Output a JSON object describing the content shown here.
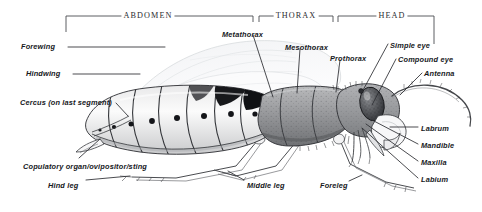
{
  "figure": {
    "kind": "entomology-anatomy-diagram",
    "background_color": "#ffffff",
    "ink_color": "#16181c"
  },
  "region_brackets": [
    {
      "id": "abdomen",
      "label": "ABDOMEN",
      "x1": 66,
      "x2": 253,
      "y": 16,
      "text_x": 148,
      "text_y": 12
    },
    {
      "id": "thorax",
      "label": "THORAX",
      "x1": 259,
      "x2": 333,
      "y": 16,
      "text_x": 296,
      "text_y": 12
    },
    {
      "id": "head",
      "label": "HEAD",
      "x1": 338,
      "x2": 434,
      "y": 16,
      "text_x": 392,
      "text_y": 12
    }
  ],
  "labels": [
    {
      "id": "forewing",
      "text": "Forewing",
      "x": 21,
      "y": 43,
      "align": "left"
    },
    {
      "id": "hindwing",
      "text": "Hindwing",
      "x": 26,
      "y": 70,
      "align": "left"
    },
    {
      "id": "cercus",
      "text": "Cercus (on last segment)",
      "x": 20,
      "y": 99,
      "align": "left"
    },
    {
      "id": "copulatory",
      "text": "Copulatory organ/ovipositor/sting",
      "x": 23,
      "y": 163,
      "align": "left"
    },
    {
      "id": "hindleg",
      "text": "Hind leg",
      "x": 48,
      "y": 182,
      "align": "left"
    },
    {
      "id": "middleleg",
      "text": "Middle leg",
      "x": 247,
      "y": 182,
      "align": "left"
    },
    {
      "id": "foreleg",
      "text": "Foreleg",
      "x": 320,
      "y": 182,
      "align": "left"
    },
    {
      "id": "metathorax",
      "text": "Metathorax",
      "x": 222,
      "y": 31,
      "align": "left"
    },
    {
      "id": "mesothorax",
      "text": "Mesothorax",
      "x": 285,
      "y": 44,
      "align": "left"
    },
    {
      "id": "prothorax",
      "text": "Prothorax",
      "x": 330,
      "y": 55,
      "align": "left"
    },
    {
      "id": "simple-eye",
      "text": "Simple eye",
      "x": 390,
      "y": 42,
      "align": "left"
    },
    {
      "id": "compound-eye",
      "text": "Compound eye",
      "x": 398,
      "y": 56,
      "align": "left"
    },
    {
      "id": "antenna",
      "text": "Antenna",
      "x": 424,
      "y": 70,
      "align": "left"
    },
    {
      "id": "labrum",
      "text": "Labrum",
      "x": 421,
      "y": 125,
      "align": "left"
    },
    {
      "id": "mandible",
      "text": "Mandible",
      "x": 421,
      "y": 142,
      "align": "left"
    },
    {
      "id": "maxilla",
      "text": "Maxilla",
      "x": 421,
      "y": 159,
      "align": "left"
    },
    {
      "id": "labium",
      "text": "Labium",
      "x": 421,
      "y": 176,
      "align": "left"
    }
  ],
  "leader_lines": [
    {
      "for": "forewing",
      "path": "M 68 47 L 165 47"
    },
    {
      "for": "hindwing",
      "path": "M 73 74 L 140 74"
    },
    {
      "for": "cercus",
      "path": "M 116 103 L 128 116"
    },
    {
      "for": "copulatory",
      "path": "M 79 158 L 100 139"
    },
    {
      "for": "hindleg",
      "path": "M 86 180 L 130 176"
    },
    {
      "for": "middleleg",
      "path": "M 244 180 L 228 171"
    },
    {
      "for": "foreleg",
      "path": "M 349 181 L 362 175"
    },
    {
      "for": "metathorax",
      "path": "M 253 35 L 273 97"
    },
    {
      "for": "mesothorax",
      "path": "M 300 49 L 297 93"
    },
    {
      "for": "prothorax",
      "path": "M 340 60 L 336 92"
    },
    {
      "for": "simple-eye",
      "path": "M 388 44 L 362 92"
    },
    {
      "for": "compound-eye",
      "path": "M 396 59 L 372 105"
    },
    {
      "for": "antenna",
      "path": "M 422 73 L 400 95"
    },
    {
      "for": "labrum",
      "path": "M 418 127 L 390 127"
    },
    {
      "for": "mandible",
      "path": "M 418 144 L 372 120"
    },
    {
      "for": "maxilla",
      "path": "M 418 161 L 366 124"
    },
    {
      "for": "labium",
      "path": "M 418 178 L 362 128"
    }
  ],
  "anatomy_parts": [
    {
      "name": "abdomen",
      "description": "banded segmented abdomen with dark spiracle dots"
    },
    {
      "name": "thorax",
      "description": "stippled grey thoracic segments"
    },
    {
      "name": "head",
      "description": "head capsule bearing eyes and mouthparts"
    },
    {
      "name": "compound-eye",
      "description": "large dark stippled oval eye"
    },
    {
      "name": "forewing",
      "description": "faint translucent anterior wing"
    },
    {
      "name": "hindwing",
      "description": "faint translucent posterior wing"
    },
    {
      "name": "antenna",
      "description": "long arcing segmented antenna"
    },
    {
      "name": "foreleg",
      "description": "anterior leg"
    },
    {
      "name": "middleleg",
      "description": "mid leg"
    },
    {
      "name": "hindleg",
      "description": "posterior leg"
    }
  ]
}
